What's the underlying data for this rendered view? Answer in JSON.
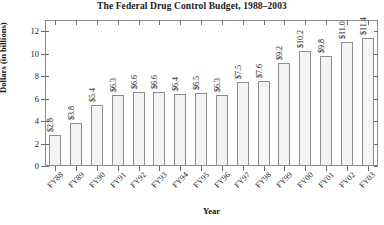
{
  "chart_data": {
    "type": "bar",
    "title": "The Federal Drug Control Budget, 1988–2003",
    "xlabel": "Year",
    "ylabel": "Dollars (in billions)",
    "categories": [
      "FY88",
      "FY89",
      "FY90",
      "FY91",
      "FY92",
      "FY93",
      "FY94",
      "FY95",
      "FY96",
      "FY97",
      "FY98",
      "FY99",
      "FY00",
      "FY01",
      "FY02",
      "FY03"
    ],
    "values": [
      2.8,
      3.8,
      5.4,
      6.3,
      6.6,
      6.6,
      6.4,
      6.5,
      6.3,
      7.5,
      7.6,
      9.2,
      10.2,
      9.8,
      11.0,
      11.4
    ],
    "data_labels": [
      "$2.8",
      "$3.8",
      "$5.4",
      "$6.3",
      "$6.6",
      "$6.6",
      "$6.4",
      "$6.5",
      "$6.3",
      "$7.5",
      "$7.6",
      "$9.2",
      "$10.2",
      "$9.8",
      "$11.0",
      "$11.4"
    ],
    "ylim": [
      0,
      13
    ],
    "yticks": [
      0,
      2,
      4,
      6,
      8,
      10,
      12
    ],
    "ytick_labels": [
      "0",
      "2",
      "4",
      "6",
      "8",
      "10",
      "12"
    ],
    "grid": false,
    "legend": false,
    "bar_fill_color": "#f3f3f3",
    "bar_edge_color": "#8d8d8d",
    "axis_color": "#8a8a8a",
    "text_color": "#1a1a1a"
  }
}
